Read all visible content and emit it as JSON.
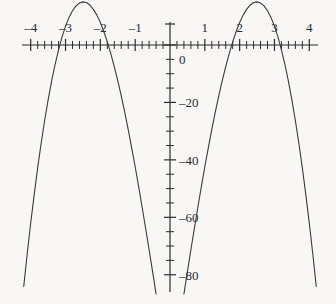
{
  "chart_data": {
    "type": "line",
    "title": "",
    "subtitle": "",
    "xlabel": "",
    "ylabel": "",
    "expression": "y = -(x^2 - 4)(x^2 - 9)",
    "xlim": [
      -4.25,
      4.25
    ],
    "ylim": [
      -86,
      8
    ],
    "axis_style": "cartesian-cross",
    "grid": false,
    "legend": null,
    "x_major_ticks": [
      -4,
      -3,
      -2,
      -1,
      0,
      1,
      2,
      3,
      4
    ],
    "x_tick_labels": [
      "–4",
      "–3",
      "–2",
      "–1",
      "",
      "1",
      "2",
      "3",
      "4"
    ],
    "x_minor_tick_step": 0.2,
    "y_major_ticks": [
      0,
      -20,
      -40,
      -60,
      -80
    ],
    "y_tick_labels": [
      "0",
      "–20",
      "–40",
      "–60",
      "–80"
    ],
    "y_minor_tick_step": 5,
    "roots": [
      -3,
      -2,
      2,
      3
    ],
    "local_maxima": [
      {
        "x": -2.55,
        "y": 6.25
      },
      {
        "x": 2.55,
        "y": 6.25
      }
    ],
    "local_minima": [
      {
        "x": 0,
        "y": -36
      }
    ],
    "x": [
      -4.2,
      -4.1,
      -4.0,
      -3.9,
      -3.8,
      -3.7,
      -3.6,
      -3.5,
      -3.4,
      -3.3,
      -3.2,
      -3.1,
      -3.0,
      -2.9,
      -2.8,
      -2.7,
      -2.6,
      -2.5,
      -2.4,
      -2.3,
      -2.2,
      -2.1,
      -2.0,
      -1.9,
      -1.8,
      -1.7,
      -1.6,
      -1.5,
      -1.4,
      -1.3,
      -1.2,
      -1.1,
      -1.0,
      -0.9,
      -0.8,
      -0.7,
      -0.6,
      -0.5,
      -0.4,
      -0.3,
      -0.2,
      -0.1,
      0.0,
      0.1,
      0.2,
      0.3,
      0.4,
      0.5,
      0.6,
      0.7,
      0.8,
      0.9,
      1.0,
      1.1,
      1.2,
      1.3,
      1.4,
      1.5,
      1.6,
      1.7,
      1.8,
      1.9,
      2.0,
      2.1,
      2.2,
      2.3,
      2.4,
      2.5,
      2.6,
      2.7,
      2.8,
      2.9,
      3.0,
      3.1,
      3.2,
      3.3,
      3.4,
      3.5,
      3.6,
      3.7,
      3.8,
      3.9,
      4.0,
      4.1,
      4.2
    ],
    "y": [
      -84.1,
      -72.7,
      -62.0,
      -52.1,
      -42.8,
      -34.2,
      -26.3,
      -19.1,
      -12.6,
      -6.8,
      -1.7,
      2.8,
      6.5,
      9.6,
      11.9,
      13.6,
      14.6,
      15.0,
      14.8,
      13.9,
      12.4,
      10.4,
      7.8,
      4.7,
      1.1,
      -3.0,
      -7.5,
      -12.4,
      -17.7,
      -23.4,
      -29.5,
      -35.8,
      -42.4,
      -49.3,
      -56.5,
      -63.8,
      -71.3,
      -78.9,
      -86.7,
      -94.6,
      -102.6,
      -110.6,
      -118.7,
      -110.6,
      -102.6,
      -94.6,
      -86.7,
      -78.9,
      -71.3,
      -63.8,
      -56.5,
      -49.3,
      -42.4,
      -35.8,
      -29.5,
      -23.4,
      -17.7,
      -12.4,
      -7.5,
      -3.0,
      1.1,
      4.7,
      7.8,
      10.4,
      12.4,
      13.9,
      14.8,
      15.0,
      14.6,
      13.6,
      11.9,
      9.6,
      6.5,
      2.8,
      -1.7,
      -6.8,
      -12.6,
      -19.1,
      -26.3,
      -34.2,
      -42.8,
      -52.1,
      -62.0,
      -72.7,
      -84.1
    ],
    "curve_color": "#3a3a3a",
    "axis_color": "#2b2b2b",
    "background_color": "#f8f7f5"
  },
  "axes": {
    "x_labels": [
      {
        "text": "–4",
        "value": -4
      },
      {
        "text": "–3",
        "value": -3
      },
      {
        "text": "–2",
        "value": -2
      },
      {
        "text": "–1",
        "value": -1
      },
      {
        "text": "1",
        "value": 1
      },
      {
        "text": "2",
        "value": 2
      },
      {
        "text": "3",
        "value": 3
      },
      {
        "text": "4",
        "value": 4
      }
    ],
    "y_labels": [
      {
        "text": "0",
        "value": 0
      },
      {
        "text": "–20",
        "value": -20
      },
      {
        "text": "–40",
        "value": -40
      },
      {
        "text": "–60",
        "value": -60
      },
      {
        "text": "–80",
        "value": -80
      }
    ]
  }
}
